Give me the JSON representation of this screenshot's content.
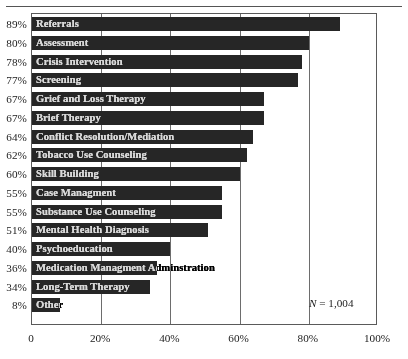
{
  "chart_data": {
    "type": "bar",
    "orientation": "horizontal",
    "title": "",
    "subtitle": "",
    "xlabel": "",
    "ylabel": "",
    "xlim": [
      0,
      100
    ],
    "xtick_labels": [
      "0",
      "20%",
      "40%",
      "60%",
      "80%",
      "100%"
    ],
    "xtick_values": [
      0,
      20,
      40,
      60,
      80,
      100
    ],
    "grid": true,
    "grid_axis": "x",
    "legend": false,
    "bar_color": "#262626",
    "frame_color": "#5a5a5a",
    "annotation": "N = 1,004",
    "annotation_n_symbol": "N",
    "annotation_n_value": "= 1,004",
    "categories": [
      "Referrals",
      "Assessment",
      "Crisis Intervention",
      "Screening",
      "Grief and Loss Therapy",
      "Brief Therapy",
      "Conflict Resolution/Mediation",
      "Tobacco Use Counseling",
      "Skill Building",
      "Case Managment",
      "Substance Use Counseling",
      "Mental Health Diagnosis",
      "Psychoeducation",
      "Medication Managment Adminstration",
      "Long-Term Therapy",
      "Other"
    ],
    "values": [
      89,
      80,
      78,
      77,
      67,
      67,
      64,
      62,
      60,
      55,
      55,
      51,
      40,
      36,
      34,
      8
    ],
    "value_labels": [
      "89%",
      "80%",
      "78%",
      "77%",
      "67%",
      "67%",
      "64%",
      "62%",
      "60%",
      "55%",
      "55%",
      "51%",
      "40%",
      "36%",
      "34%",
      "8%"
    ]
  }
}
